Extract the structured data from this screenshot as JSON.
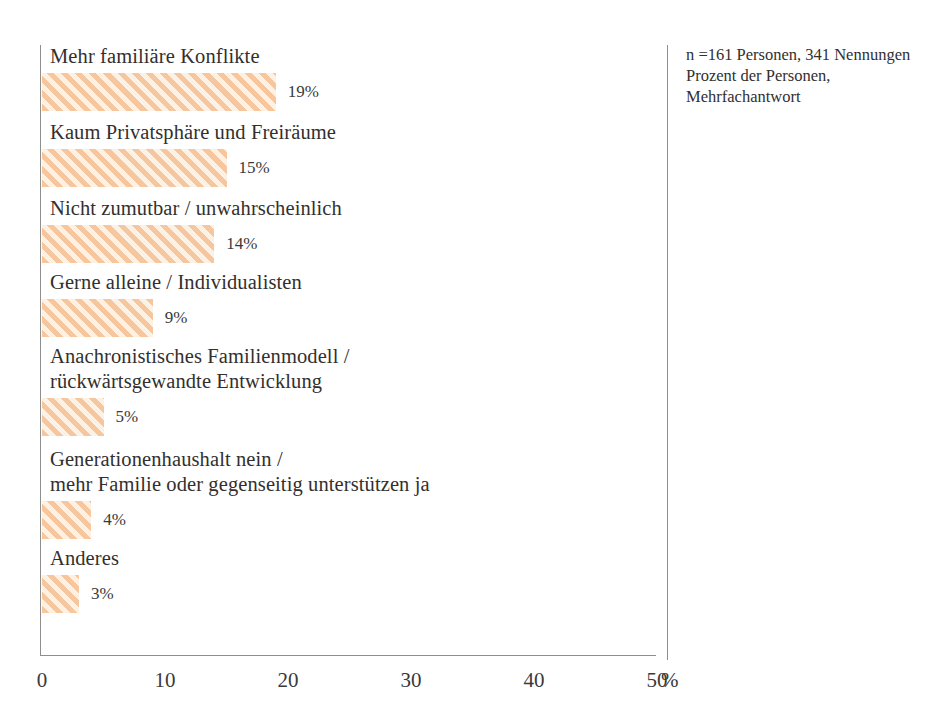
{
  "chart_data": {
    "type": "bar",
    "orientation": "horizontal",
    "title": "",
    "xlabel": "%",
    "ylabel": "",
    "xlim": [
      0,
      50
    ],
    "xticks": [
      "0",
      "10",
      "20",
      "30",
      "40",
      "50"
    ],
    "grid": false,
    "legend": null,
    "bar_color": "#f6c79e",
    "bar_fill_background": "#fdf3e7",
    "bar_hatch": "diagonal-45",
    "axis_color": "#8e8e8e",
    "categories": [
      "Mehr familiäre Konflikte",
      "Kaum Privatsphäre und Freiräume",
      "Nicht zumutbar / unwahrscheinlich",
      "Gerne alleine / Individualisten",
      "Anachronistisches Familienmodell /\nrückwärtsgewandte Entwicklung",
      "Generationenhaushalt nein /\nmehr Familie oder gegenseitig unterstützen ja",
      "Anderes"
    ],
    "values": [
      19,
      15,
      14,
      9,
      5,
      4,
      3
    ],
    "value_labels": [
      "19%",
      "15%",
      "14%",
      "9%",
      "5%",
      "4%",
      "3%"
    ],
    "annotations": [
      "n =161 Personen, 341 Nennungen",
      "Prozent der Personen,",
      "Mehrfachantwort"
    ]
  },
  "axis": {
    "unit_symbol": "%"
  }
}
